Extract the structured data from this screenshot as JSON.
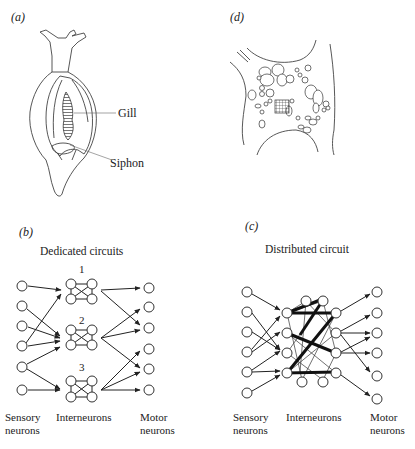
{
  "figure": {
    "panels": [
      {
        "id": "a",
        "label": "(a)",
        "subject": "Aplysia",
        "annotations": [
          {
            "text": "Gill"
          },
          {
            "text": "Siphon"
          }
        ]
      },
      {
        "id": "d",
        "label": "(d)",
        "subject": "Ganglion cell clusters"
      },
      {
        "id": "b",
        "label": "(b)",
        "title": "Dedicated circuits",
        "circuit_numbers": [
          "1",
          "2",
          "3"
        ],
        "axis_labels": {
          "sensory": [
            "Sensory",
            "neurons"
          ],
          "inter": "Interneurons",
          "motor": [
            "Motor",
            "neurons"
          ]
        }
      },
      {
        "id": "c",
        "label": "(c)",
        "title": "Distributed circuit",
        "axis_labels": {
          "sensory": [
            "Sensory",
            "neurons"
          ],
          "inter": "Interneurons",
          "motor": [
            "Motor",
            "neurons"
          ]
        }
      }
    ]
  },
  "colors": {
    "ink": "#222222",
    "background": "#ffffff"
  }
}
